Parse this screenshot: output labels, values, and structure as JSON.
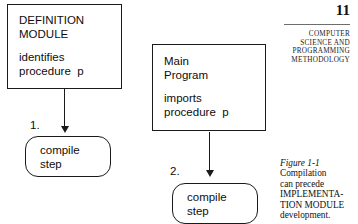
{
  "page": {
    "number": "11",
    "running_head_lines": [
      "COMPUTER",
      "SCIENCE AND",
      "PROGRAMMING",
      "METHODOLOGY"
    ]
  },
  "diagram": {
    "definition_module": {
      "header": "DEFINITION\nMODULE",
      "body": "identifies\nprocedure  p"
    },
    "main_program": {
      "header": "Main\nProgram",
      "body": "imports\nprocedure  p"
    },
    "compile_step_1": {
      "number": "1.",
      "label": "compile\nstep"
    },
    "compile_step_2": {
      "number": "2.",
      "label": "compile\nstep"
    }
  },
  "figure": {
    "label": "Figure 1-1",
    "caption_lines": [
      "Compilation",
      "can precede",
      "IMPLEMENTA-",
      "TION MODULE",
      "development."
    ]
  },
  "colors": {
    "ink": "#111111",
    "rule": "#6d6d6d",
    "paper": "#ffffff"
  }
}
